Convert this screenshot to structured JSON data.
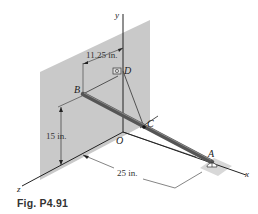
{
  "figure": {
    "caption": "Fig. P4.91",
    "axes": {
      "x": "x",
      "y": "y",
      "z": "z"
    },
    "points": {
      "origin": "O",
      "A": "A",
      "B": "B",
      "C": "C",
      "D": "D"
    },
    "dimensions": {
      "horizontal_offset": "11.25 in.",
      "height": "15 in.",
      "length": "25 in."
    },
    "colors": {
      "wall": "#c9c9c9",
      "rod": "#555555",
      "lines": "#222222",
      "support": "#d8d8d8"
    }
  }
}
